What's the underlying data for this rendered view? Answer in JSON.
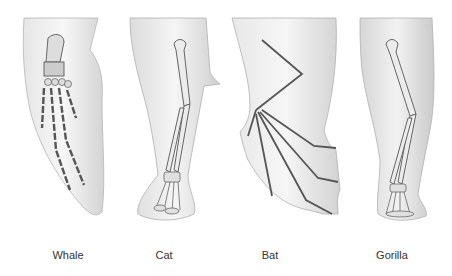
{
  "figure": {
    "limbs": [
      {
        "label": "Whale",
        "kind": "flipper"
      },
      {
        "label": "Cat",
        "kind": "leg"
      },
      {
        "label": "Bat",
        "kind": "wing"
      },
      {
        "label": "Gorilla",
        "kind": "arm"
      }
    ]
  },
  "colors": {
    "skin_light": "#f2f2f2",
    "skin_shade": "#c8c8c8",
    "bone": "#e8e8e8",
    "bone_outline": "#6a6a6a",
    "label": "#333333"
  }
}
